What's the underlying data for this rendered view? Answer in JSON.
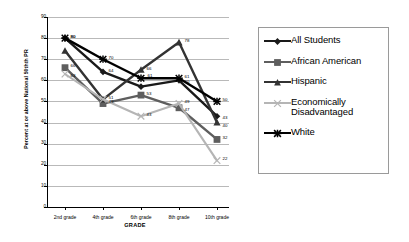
{
  "chart_data": {
    "type": "line",
    "title": "",
    "xlabel": "GRADE",
    "ylabel": "Percent at or above National 50thth PR",
    "categories": [
      "2nd grade",
      "4th grade",
      "6th grade",
      "8th grade",
      "10th grade"
    ],
    "ylim": [
      0,
      90
    ],
    "yticks": [
      0,
      10,
      20,
      30,
      40,
      50,
      60,
      70,
      80,
      90
    ],
    "grid": true,
    "legend_position": "right",
    "series": [
      {
        "name": "All Students",
        "marker": "diamond",
        "color": "#1a1a1a",
        "values": [
          80,
          64,
          57,
          60,
          43
        ],
        "labels": [
          "80",
          "64",
          "",
          "60",
          "43"
        ]
      },
      {
        "name": "African American",
        "marker": "square",
        "color": "#5e5e5e",
        "values": [
          66,
          49,
          53,
          47,
          32
        ],
        "labels": [
          "66",
          "49",
          "53",
          "47",
          "32"
        ]
      },
      {
        "name": "Hispanic",
        "marker": "triangle",
        "color": "#333333",
        "values": [
          74,
          51,
          65,
          78,
          40
        ],
        "labels": [
          "",
          "51",
          "66",
          "78",
          "40"
        ]
      },
      {
        "name": "Economically Disadvantaged",
        "marker": "x",
        "color": "#b5b5b5",
        "values": [
          63,
          51,
          43,
          49,
          22
        ],
        "labels": [
          "63",
          "",
          "43",
          "49",
          "22"
        ]
      },
      {
        "name": "White",
        "marker": "asterisk",
        "color": "#000000",
        "values": [
          80,
          70,
          61,
          61,
          50
        ],
        "labels": [
          "80",
          "70",
          "61",
          "61",
          "50"
        ]
      }
    ]
  },
  "legend": {
    "items": [
      {
        "label": "All Students"
      },
      {
        "label": "African American"
      },
      {
        "label": "Hispanic"
      },
      {
        "label": "Economically"
      },
      {
        "label": "Disadvantaged"
      },
      {
        "label": "White"
      }
    ]
  }
}
